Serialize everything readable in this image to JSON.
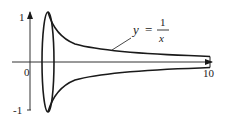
{
  "figure": {
    "function_label": {
      "y": "y",
      "equals": "=",
      "numerator": "1",
      "denominator": "x"
    },
    "axes": {
      "y_ticks": [
        {
          "label": "1"
        },
        {
          "label": "-1"
        }
      ],
      "origin_label": "0",
      "x_end_label": "10"
    },
    "colors": {
      "stroke": "#1a1a1a",
      "axis": "#333333",
      "background": "#ffffff"
    }
  }
}
